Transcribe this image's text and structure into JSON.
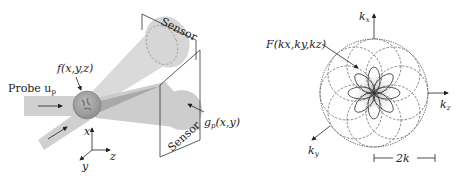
{
  "figure": {
    "left_panel": {
      "name": "experimental-setup",
      "probe_label": "Probe u",
      "probe_sub": "p",
      "object_label": "f(x,y,z)",
      "sensor_top_label": "Sensor",
      "sensor_bottom_label": "Sensor",
      "measurement_label": "g",
      "measurement_sub": "p",
      "measurement_args": "(x,y)",
      "axes": {
        "x": "x",
        "y": "y",
        "z": "z"
      }
    },
    "right_panel": {
      "name": "fourier-space-coverage",
      "spectrum_label": "F(k",
      "spectrum_full": "F(kx,ky,kz)",
      "axes": {
        "kx": "k",
        "kx_sub": "x",
        "ky": "k",
        "ky_sub": "y",
        "kz": "k",
        "kz_sub": "z"
      },
      "scale_label": "2k",
      "num_petals": 8
    },
    "colors": {
      "beam": "#d0d0d0",
      "beam_dark": "#b8b8b8",
      "sphere": "#a8a8a8",
      "line": "#333333",
      "dashed": "#555555"
    }
  }
}
